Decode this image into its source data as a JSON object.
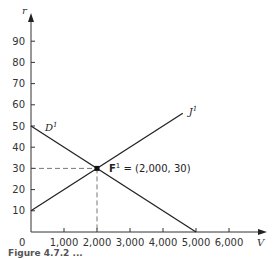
{
  "chart_data": {
    "type": "line",
    "title": "",
    "xlabel": "V",
    "ylabel": "r",
    "xlim": [
      0,
      7000
    ],
    "ylim": [
      0,
      100
    ],
    "x_ticks": [
      0,
      1000,
      2000,
      3000,
      4000,
      5000,
      6000
    ],
    "x_tick_labels": [
      "0",
      "1,000",
      "2,000",
      "3,000",
      "4,000",
      "5,000",
      "6,000"
    ],
    "y_ticks": [
      10,
      20,
      30,
      40,
      50,
      60,
      70,
      80,
      90
    ],
    "y_tick_labels": [
      "10",
      "20",
      "30",
      "40",
      "50",
      "60",
      "70",
      "80",
      "90"
    ],
    "grid": false,
    "series": [
      {
        "name": "D¹",
        "label_sup": "1",
        "label_base": "D",
        "x": [
          0,
          5000
        ],
        "y": [
          50,
          0
        ],
        "color": "#222222"
      },
      {
        "name": "J¹",
        "label_sup": "1",
        "label_base": "J",
        "x": [
          0,
          4600
        ],
        "y": [
          10,
          56
        ],
        "color": "#222222"
      }
    ],
    "annotations": [
      {
        "type": "point",
        "name": "F¹",
        "label_base": "F",
        "label_sup": "1",
        "x": 2000,
        "y": 30,
        "text": " = (2,000, 30)"
      },
      {
        "type": "guide-lines",
        "style": "dashed",
        "x": 2000,
        "y": 30
      }
    ]
  },
  "caption": "Figure 4.7.2  ..."
}
